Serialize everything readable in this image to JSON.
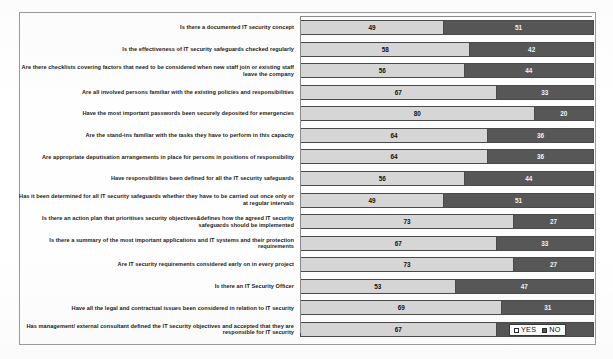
{
  "chart_data": {
    "type": "bar",
    "subtype": "stacked-horizontal-100-percent",
    "title": "",
    "xlabel": "",
    "ylabel": "",
    "xlim": [
      0,
      100
    ],
    "grid": false,
    "legend_position": "bottom-right",
    "categories": [
      "Is there a documented IT security concept",
      "Is the effectiveness of IT security safeguards checked regularly",
      "Are there checklists covering factors that need to be considered when new staff join or existing staff leave the company",
      "Are all involved persons familiar with the existing policies and responsibilities",
      "Have the most important passwords been securely deposited for emergencies",
      "Are the stand-ins familiar with the tasks they have to perform in this capacity",
      "Are appropriate deputisation arrangements in place for persons in positions of responsibility",
      "Have responsibilities been defined for all the IT security safeguards",
      "Has it been determined for all IT security safeguards whether they have to be carried out once only or at regular intervals",
      "Is there an action plan that prioritises security objectives&defines how the agreed IT security safeguards should be implemented",
      "Is there a summary of the most important applications and IT systems and their protection requirements",
      "Are IT security requirements considered early on in every project",
      "Is there an IT Security Officer",
      "Have all the legal and contractual issues been considered in relation to IT security",
      "Has management/ external consultant defined the IT security objectives and accepted that they are responsible for IT security"
    ],
    "series": [
      {
        "name": "YES",
        "color": "#d6d6d6",
        "values": [
          49,
          58,
          56,
          67,
          80,
          64,
          64,
          56,
          49,
          73,
          67,
          73,
          53,
          69,
          67
        ]
      },
      {
        "name": "NO",
        "color": "#575757",
        "values": [
          51,
          42,
          44,
          33,
          20,
          36,
          36,
          44,
          51,
          27,
          33,
          27,
          47,
          31,
          33
        ]
      }
    ]
  },
  "legend": {
    "items": [
      {
        "label": "YES",
        "swatch": "legend-swatch-yes"
      },
      {
        "label": "NO",
        "swatch": "legend-swatch-no"
      }
    ]
  }
}
